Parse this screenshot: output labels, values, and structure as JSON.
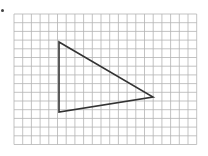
{
  "grid": {
    "x0": 14,
    "y0": 14,
    "cols": 21,
    "rows": 15,
    "cell": 8.7,
    "line_color": "#b4b4b4"
  },
  "triangle": {
    "vertices": [
      [
        59,
        42
      ],
      [
        153,
        97
      ],
      [
        59,
        112
      ]
    ],
    "stroke_color": "#333333",
    "stroke_width": 1.6
  }
}
